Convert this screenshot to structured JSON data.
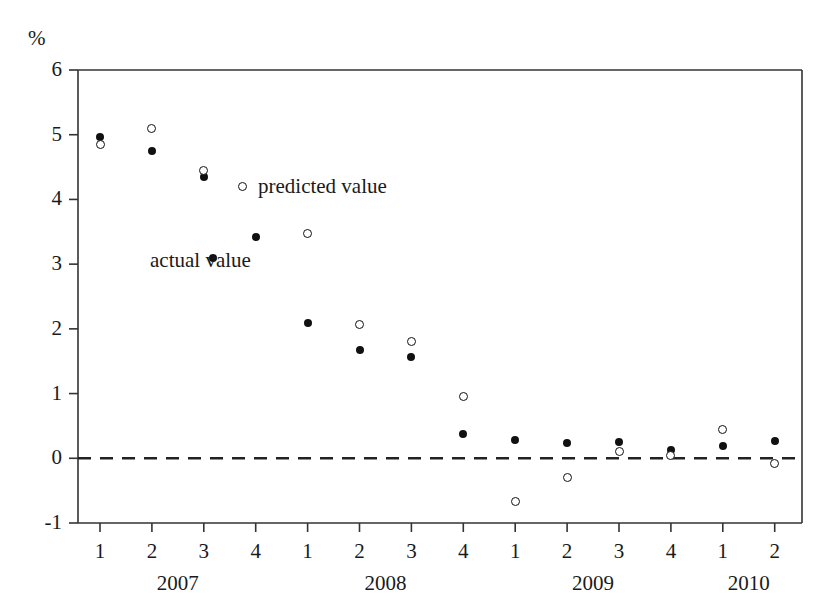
{
  "chart_data": {
    "type": "scatter",
    "title": "",
    "subtitle": "",
    "xlabel": "",
    "ylabel": "%",
    "ylim": [
      -1,
      6
    ],
    "yticks": [
      6,
      5,
      4,
      3,
      2,
      1,
      0,
      -1
    ],
    "ytick_labels": [
      "6",
      "5",
      "4",
      "3",
      "2",
      "1",
      "0",
      "-1"
    ],
    "grid": false,
    "legend_position": "inside-upper-left",
    "zero_line": {
      "value": 0,
      "style": "dashed"
    },
    "categories": [
      "1",
      "2",
      "3",
      "4",
      "1",
      "2",
      "3",
      "4",
      "1",
      "2",
      "3",
      "4",
      "1",
      "2"
    ],
    "year_groups": [
      {
        "label": "2007",
        "start_index": 0,
        "end_index": 3
      },
      {
        "label": "2008",
        "start_index": 4,
        "end_index": 7
      },
      {
        "label": "2009",
        "start_index": 8,
        "end_index": 11
      },
      {
        "label": "2010",
        "start_index": 12,
        "end_index": 13
      }
    ],
    "series": [
      {
        "name": "actual value",
        "marker": "filled-circle",
        "color": "#111111",
        "values": [
          4.97,
          4.75,
          4.35,
          3.42,
          2.09,
          1.68,
          1.56,
          0.37,
          0.28,
          0.24,
          0.25,
          0.13,
          0.19,
          0.26
        ]
      },
      {
        "name": "predicted value",
        "marker": "open-circle",
        "color": "#111111",
        "values": [
          4.85,
          5.09,
          4.45,
          null,
          3.47,
          2.07,
          1.8,
          0.95,
          -0.67,
          -0.29,
          0.11,
          0.04,
          0.45,
          -0.08
        ]
      }
    ],
    "legend": [
      {
        "label": "predicted value",
        "marker": "open-circle"
      },
      {
        "label": "actual value",
        "marker": "filled-circle"
      }
    ]
  },
  "axis": {
    "unit_label": "%"
  }
}
